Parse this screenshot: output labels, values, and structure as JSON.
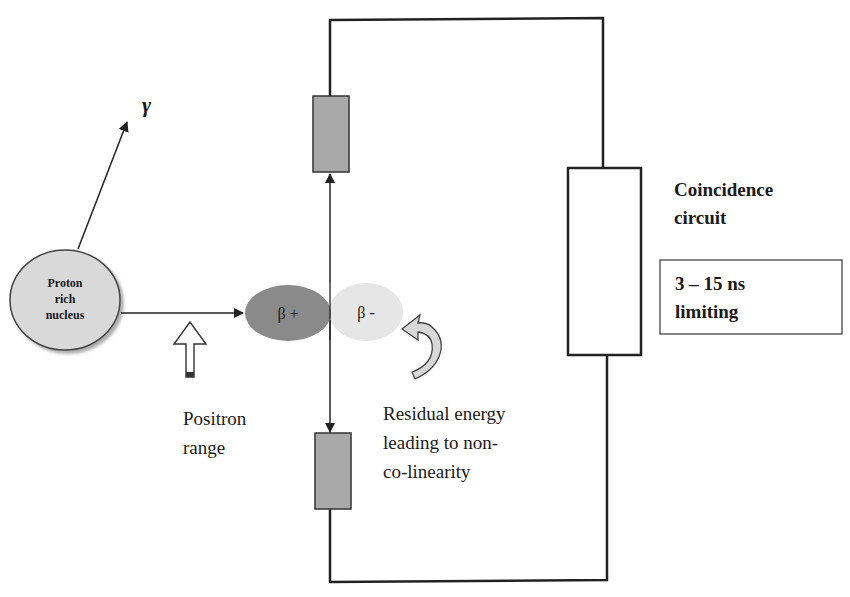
{
  "diagram": {
    "type": "PET annihilation coincidence detection schematic",
    "colors": {
      "line": "#222222",
      "detector_fill": "#a9a9a9",
      "nucleus_fill": "#d9d9d9",
      "beta_plus_fill": "#8a8a8a",
      "beta_minus_fill": "#e6e6e6",
      "box_fill": "#ffffff"
    },
    "labels": {
      "gamma": "γ",
      "nucleus_line1": "Proton",
      "nucleus_line2": "rich",
      "nucleus_line3": "nucleus",
      "beta_plus": "β +",
      "beta_minus": "β -",
      "positron_range_line1": "Positron",
      "positron_range_line2": "range",
      "residual_line1": "Residual energy",
      "residual_line2": "leading to non-",
      "residual_line3": "co-linearity",
      "coincidence_line1": "Coincidence",
      "coincidence_line2": "circuit",
      "timing_line1": "3 – 15 ns",
      "timing_line2": "limiting"
    },
    "nodes": [
      {
        "id": "nucleus",
        "shape": "ellipse",
        "label": "Proton rich nucleus"
      },
      {
        "id": "beta_plus",
        "shape": "ellipse",
        "label": "β +"
      },
      {
        "id": "beta_minus",
        "shape": "ellipse",
        "label": "β -"
      },
      {
        "id": "detector_top",
        "shape": "rect"
      },
      {
        "id": "detector_bottom",
        "shape": "rect"
      },
      {
        "id": "coincidence_circuit",
        "shape": "rect",
        "label": "Coincidence circuit"
      },
      {
        "id": "timing_box",
        "shape": "rect",
        "label": "3 – 15 ns limiting"
      }
    ],
    "edges": [
      {
        "from": "nucleus",
        "to": "gamma",
        "type": "arrow"
      },
      {
        "from": "nucleus",
        "to": "beta_plus",
        "type": "arrow"
      },
      {
        "from": "annihilation_point",
        "to": "detector_top",
        "type": "arrow"
      },
      {
        "from": "annihilation_point",
        "to": "detector_bottom",
        "type": "arrow"
      },
      {
        "from": "detector_top",
        "to": "coincidence_circuit",
        "type": "wire"
      },
      {
        "from": "detector_bottom",
        "to": "coincidence_circuit",
        "type": "wire"
      }
    ]
  }
}
